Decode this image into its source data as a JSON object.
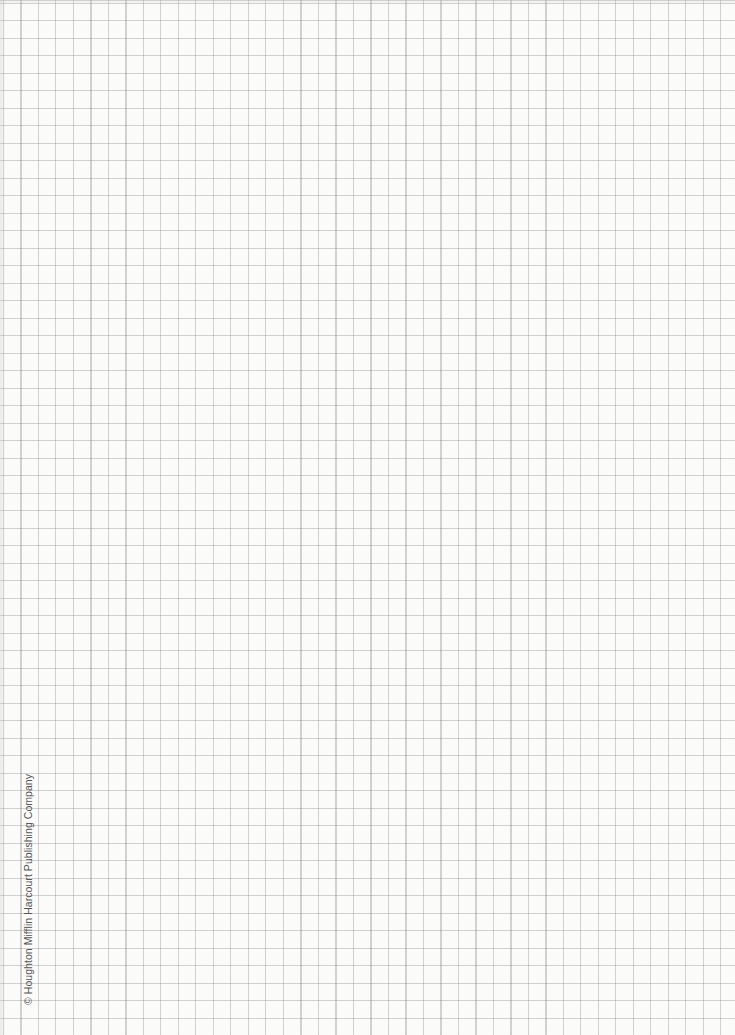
{
  "document": {
    "type": "graph-paper",
    "grid": {
      "cell_size_px": 17.5,
      "line_color": "#9a9a9a",
      "background_color": "#fbfbfa"
    },
    "copyright": "© Houghton Mifflin Harcourt Publishing Company"
  }
}
